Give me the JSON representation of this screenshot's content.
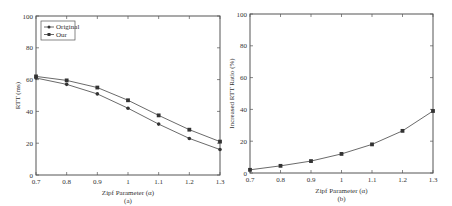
{
  "chart_data": [
    {
      "type": "line",
      "title": "",
      "caption": "(a)",
      "xlabel": "Zipf Parameter (α)",
      "ylabel": "RTT (ms)",
      "x": [
        0.7,
        0.8,
        0.9,
        1.0,
        1.1,
        1.2,
        1.3
      ],
      "x_tick_labels": [
        "0.7",
        "0.8",
        "0.9",
        "1",
        "1.1",
        "1.2",
        "1.3"
      ],
      "y_tick_labels": [
        "0",
        "20",
        "40",
        "60",
        "80",
        "100"
      ],
      "xlim": [
        0.7,
        1.3
      ],
      "ylim": [
        0,
        100
      ],
      "grid": false,
      "legend_position": "upper left",
      "series": [
        {
          "name": "Original",
          "marker": "circle",
          "values": [
            61,
            57,
            51,
            42,
            32,
            23,
            16
          ]
        },
        {
          "name": "Our",
          "marker": "square",
          "values": [
            62,
            59.5,
            55,
            47,
            37.5,
            28.5,
            21
          ]
        }
      ]
    },
    {
      "type": "line",
      "title": "",
      "caption": "(b)",
      "xlabel": "Zipf Parameter (α)",
      "ylabel": "Increased RTT Ratio (%)",
      "x": [
        0.7,
        0.8,
        0.9,
        1.0,
        1.1,
        1.2,
        1.3
      ],
      "x_tick_labels": [
        "0.7",
        "0.8",
        "0.9",
        "1",
        "1.1",
        "1.2",
        "1.3"
      ],
      "y_tick_labels": [
        "0",
        "20",
        "40",
        "60",
        "80",
        "100"
      ],
      "xlim": [
        0.7,
        1.3
      ],
      "ylim": [
        0,
        100
      ],
      "grid": false,
      "legend_position": "none",
      "series": [
        {
          "name": "Increased RTT Ratio",
          "marker": "square",
          "values": [
            2,
            4.5,
            7.5,
            12,
            18,
            26.5,
            39
          ]
        }
      ]
    }
  ]
}
